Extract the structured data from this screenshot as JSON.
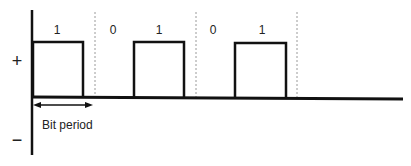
{
  "diagram": {
    "type": "unipolar-nrz-rz-pulse-waveform",
    "bits": [
      {
        "value": "1",
        "label_x": 57
      },
      {
        "value": "0",
        "label_x": 113
      },
      {
        "value": "1",
        "label_x": 159
      },
      {
        "value": "0",
        "label_x": 213
      },
      {
        "value": "1",
        "label_x": 262
      }
    ],
    "axis": {
      "positive_label": "+",
      "negative_label": "−"
    },
    "annotation": {
      "bit_period_label": "Bit period"
    },
    "colors": {
      "line": "#111111",
      "dashed": "#999999",
      "text": "#222222"
    }
  }
}
